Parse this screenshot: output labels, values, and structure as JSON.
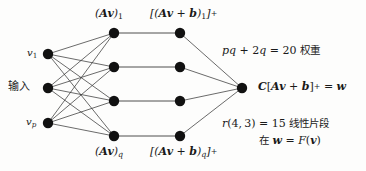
{
  "figure": {
    "background_color": "#fdfdfc",
    "node_color": "#111111",
    "edge_color": "#3a3a3a",
    "labels": {
      "top_left": "(Av)_1",
      "top_right": "[(Av + b)_1]_+",
      "bottom_left": "(Av)_q",
      "bottom_right": "[(Av + b)_q]_+",
      "input_first": "v_1",
      "input_last": "v_p",
      "input_word": "输入",
      "weights_note": "pq + 2q = 20 权重",
      "output_expr": "C[Av + b]_+ = w",
      "pieces_note": "r(4,3) = 15 线性片段",
      "pieces_note2": "在 w = F(v)"
    },
    "values": {
      "weights_count": 20,
      "weights_formula": "pq + 2q",
      "pieces_count": 15,
      "pieces_formula": "r(4,3)",
      "input_nodes": 3,
      "hidden_nodes": 4,
      "second_layer_nodes": 4,
      "output_nodes": 1
    },
    "geometry": {
      "input_x": 48,
      "input_y": [
        54,
        88,
        123
      ],
      "hidden1_x": 114,
      "hidden2_x": 180,
      "hidden_y": [
        33,
        67,
        101,
        136
      ],
      "output_x": 242,
      "output_y": 88,
      "node_radius": 5.2
    }
  }
}
